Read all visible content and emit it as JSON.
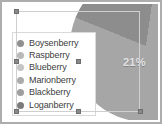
{
  "chart_data": {
    "type": "pie",
    "title": "",
    "legend_position": "left-overlay",
    "categories": [
      "Boysenberry",
      "Raspberry",
      "Blueberry",
      "Marionberry",
      "Blackberry",
      "Loganberry"
    ],
    "values": [
      21,
      20,
      17,
      15,
      14,
      13
    ],
    "data_labels": [
      "21%"
    ],
    "visible_label": "21%",
    "colors": [
      "#8f8f8f",
      "#b5b5b5",
      "#c2c2c2",
      "#a8a8a8",
      "#9c9c9c",
      "#7d7d7d"
    ],
    "slice_colors_on_pie": [
      "#8d8d8d",
      "#a6a6a6"
    ],
    "grid": false
  },
  "legend": {
    "items": [
      {
        "label": "Boysenberry",
        "swatch": "#8f8f8f"
      },
      {
        "label": "Raspberry",
        "swatch": "#b9b9b9"
      },
      {
        "label": "Blueberry",
        "swatch": "#c4c4c4"
      },
      {
        "label": "Marionberry",
        "swatch": "#ababab"
      },
      {
        "label": "Blackberry",
        "swatch": "#9e9e9e"
      },
      {
        "label": "Loganberry",
        "swatch": "#7b7b7b"
      }
    ]
  },
  "pie": {
    "label_21": "21%",
    "slice_dark_color": "#8d8d8d",
    "slice_light_color": "#a6a6a6"
  },
  "canvas": {
    "background": "#ffffff",
    "frame_color": "#adadad"
  },
  "selection": {
    "outline_color": "#cfcfcf",
    "handle_color": "#8a8a8a",
    "handles": [
      "top-left",
      "middle-left",
      "bottom-left",
      "middle-center",
      "bottom-center",
      "bottom-right"
    ]
  }
}
